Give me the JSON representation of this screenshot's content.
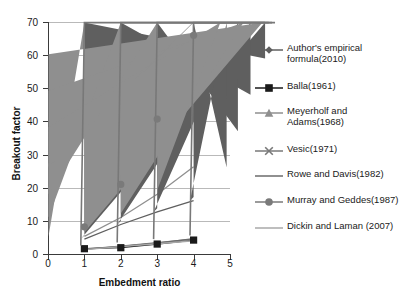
{
  "chart_data": {
    "type": "line",
    "title": "",
    "xlabel": "Embedment ratio",
    "ylabel": "Breakout factor",
    "xlim": [
      0,
      5
    ],
    "ylim": [
      0,
      70
    ],
    "xticks": [
      "0",
      "1",
      "2",
      "3",
      "4",
      "5"
    ],
    "yticks": [
      "0",
      "10",
      "20",
      "30",
      "40",
      "50",
      "60",
      "70"
    ],
    "grid": "horizontal",
    "legend_position": "right",
    "x": [
      1,
      2,
      3,
      4
    ],
    "series": [
      {
        "name": "Author's empirical formula(2010)",
        "marker": "diamond",
        "color": "#5f5f5f",
        "values": [
          4.5,
          8.9,
          12.7,
          16.1
        ]
      },
      {
        "name": "Balla(1961)",
        "marker": "square",
        "color": "#1a1a1a",
        "values": [
          1.6,
          1.9,
          3.0,
          4.2
        ]
      },
      {
        "name": "Meyerholf and Adams(1968)",
        "marker": "triangle",
        "color": "#8f8f8f",
        "values": [
          5.3,
          11.0,
          18.0,
          26.3
        ]
      },
      {
        "name": "Vesic(1971)",
        "marker": "cross",
        "color": "#787878",
        "values": [
          1.5,
          2.4,
          3.4,
          4.5
        ]
      },
      {
        "name": "Rowe and Davis(1982)",
        "marker": "none",
        "color": "#6b6b6b",
        "values": [
          1.4,
          2.3,
          3.3,
          4.6
        ]
      },
      {
        "name": "Murray and Geddes(1987)",
        "marker": "circle",
        "color": "#7a7a7a",
        "values": [
          8.2,
          21.0,
          40.7,
          66.0
        ]
      },
      {
        "name": "Dickin and Laman (2007)",
        "marker": "none",
        "color": "#a8a8a8",
        "values": [
          1.3,
          2.2,
          3.1,
          4.0
        ]
      }
    ]
  },
  "legend": {
    "items": [
      {
        "label_line1": "Author's empirical",
        "label_line2": "formula(2010)"
      },
      {
        "label_line1": "Balla(1961)",
        "label_line2": ""
      },
      {
        "label_line1": "Meyerholf and",
        "label_line2": "Adams(1968)"
      },
      {
        "label_line1": "Vesic(1971)",
        "label_line2": ""
      },
      {
        "label_line1": "Rowe and Davis(1982)",
        "label_line2": ""
      },
      {
        "label_line1": "Murray and Geddes(1987)",
        "label_line2": ""
      },
      {
        "label_line1": "Dickin and Laman (2007)",
        "label_line2": ""
      }
    ]
  }
}
